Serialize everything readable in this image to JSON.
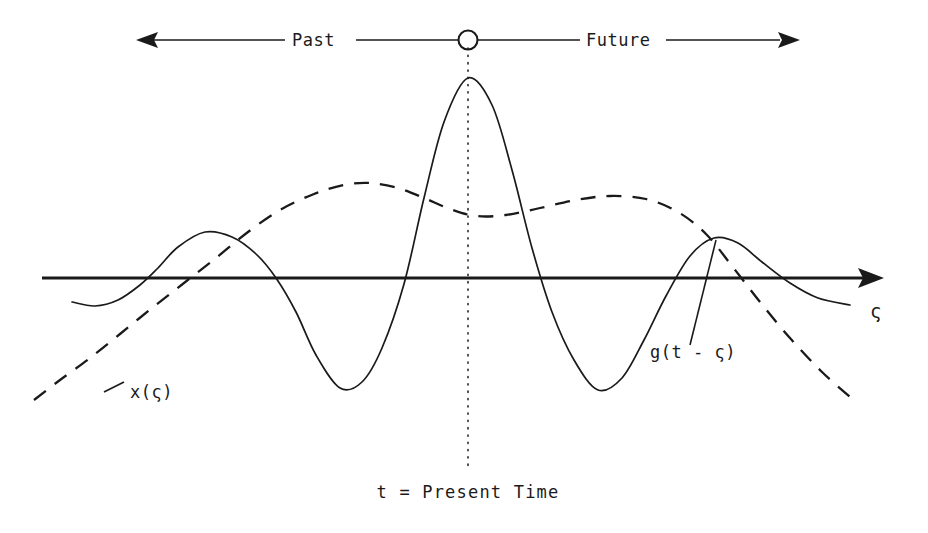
{
  "figure": {
    "background_color": "#ffffff",
    "ink_color": "#1a1a1a",
    "timeline": {
      "past_label": "Past",
      "future_label": "Future",
      "present_marker_icon": "open-circle-marker",
      "left_arrow_icon": "arrow-left-icon",
      "right_arrow_icon": "arrow-right-icon"
    },
    "axis": {
      "symbol": "ς",
      "arrow_icon": "arrow-right-icon"
    },
    "labels": {
      "signal": "x(ς)",
      "filter": "g(t - ς)",
      "present_time": "t = Present Time"
    }
  },
  "chart_data": {
    "type": "line",
    "title": "",
    "subtitle": "",
    "xlabel": "ς",
    "ylabel": "",
    "grid": false,
    "legend_position": "inline-annotations",
    "annotations": [
      {
        "text": "Past",
        "x": 310,
        "y": 40,
        "role": "timeline-left-region"
      },
      {
        "text": "Future",
        "x": 615,
        "y": 40,
        "role": "timeline-right-region"
      },
      {
        "text": "x(ς)",
        "x": 130,
        "y": 392,
        "role": "dashed-curve-label"
      },
      {
        "text": "g(t - ς)",
        "x": 700,
        "y": 352,
        "role": "solid-curve-label"
      },
      {
        "text": "t = Present Time",
        "x": 468,
        "y": 492,
        "role": "present-time-caption"
      },
      {
        "text": "ς",
        "x": 878,
        "y": 312,
        "role": "x-axis-symbol"
      }
    ],
    "axis_line": {
      "x_start": 42,
      "x_end": 882,
      "y": 278,
      "arrow": "right"
    },
    "present_time_line": {
      "x": 468,
      "y_top": 48,
      "y_bottom": 470,
      "style": "dotted"
    },
    "series": [
      {
        "name": "g(t - ς)",
        "style": "solid",
        "description": "time-reversed sinc-like filter impulse response centered at present time t",
        "points": [
          {
            "x": 72,
            "y": 302
          },
          {
            "x": 95,
            "y": 306
          },
          {
            "x": 118,
            "y": 300
          },
          {
            "x": 140,
            "y": 285
          },
          {
            "x": 158,
            "y": 268
          },
          {
            "x": 178,
            "y": 247
          },
          {
            "x": 205,
            "y": 232
          },
          {
            "x": 232,
            "y": 237
          },
          {
            "x": 256,
            "y": 254
          },
          {
            "x": 276,
            "y": 278
          },
          {
            "x": 296,
            "y": 312
          },
          {
            "x": 316,
            "y": 355
          },
          {
            "x": 340,
            "y": 388
          },
          {
            "x": 362,
            "y": 382
          },
          {
            "x": 382,
            "y": 348
          },
          {
            "x": 404,
            "y": 284
          },
          {
            "x": 424,
            "y": 198
          },
          {
            "x": 444,
            "y": 122
          },
          {
            "x": 468,
            "y": 78
          },
          {
            "x": 492,
            "y": 105
          },
          {
            "x": 512,
            "y": 170
          },
          {
            "x": 532,
            "y": 248
          },
          {
            "x": 552,
            "y": 312
          },
          {
            "x": 574,
            "y": 360
          },
          {
            "x": 598,
            "y": 390
          },
          {
            "x": 622,
            "y": 378
          },
          {
            "x": 644,
            "y": 340
          },
          {
            "x": 666,
            "y": 296
          },
          {
            "x": 690,
            "y": 256
          },
          {
            "x": 714,
            "y": 238
          },
          {
            "x": 738,
            "y": 243
          },
          {
            "x": 762,
            "y": 262
          },
          {
            "x": 790,
            "y": 283
          },
          {
            "x": 818,
            "y": 298
          },
          {
            "x": 850,
            "y": 305
          }
        ]
      },
      {
        "name": "x(ς)",
        "style": "dashed",
        "description": "input signal, slow smooth waveform rising through the past and falling after the present",
        "points": [
          {
            "x": 34,
            "y": 400
          },
          {
            "x": 60,
            "y": 380
          },
          {
            "x": 90,
            "y": 358
          },
          {
            "x": 120,
            "y": 334
          },
          {
            "x": 152,
            "y": 308
          },
          {
            "x": 184,
            "y": 283
          },
          {
            "x": 216,
            "y": 258
          },
          {
            "x": 248,
            "y": 232
          },
          {
            "x": 280,
            "y": 210
          },
          {
            "x": 314,
            "y": 194
          },
          {
            "x": 344,
            "y": 185
          },
          {
            "x": 370,
            "y": 183
          },
          {
            "x": 398,
            "y": 188
          },
          {
            "x": 424,
            "y": 198
          },
          {
            "x": 450,
            "y": 209
          },
          {
            "x": 476,
            "y": 216
          },
          {
            "x": 506,
            "y": 215
          },
          {
            "x": 540,
            "y": 208
          },
          {
            "x": 576,
            "y": 200
          },
          {
            "x": 610,
            "y": 196
          },
          {
            "x": 646,
            "y": 199
          },
          {
            "x": 678,
            "y": 212
          },
          {
            "x": 706,
            "y": 234
          },
          {
            "x": 732,
            "y": 266
          },
          {
            "x": 760,
            "y": 302
          },
          {
            "x": 790,
            "y": 338
          },
          {
            "x": 822,
            "y": 372
          },
          {
            "x": 856,
            "y": 402
          }
        ]
      }
    ]
  }
}
